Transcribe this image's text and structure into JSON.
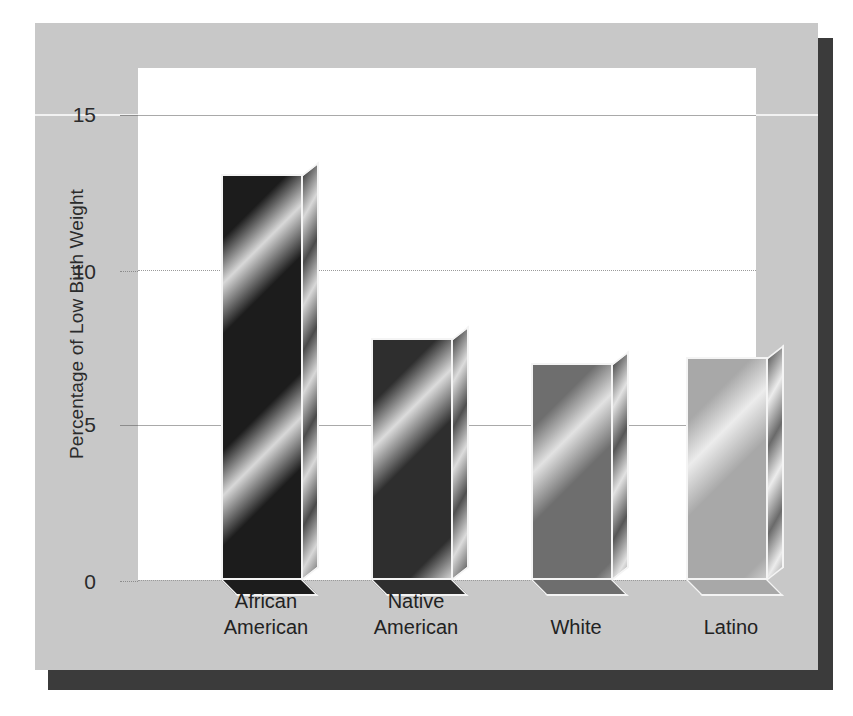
{
  "figure": {
    "background_color": "#c8c8c8",
    "plot_background_color": "#ffffff",
    "shadow_color": "#3b3b3b"
  },
  "chart_data": {
    "type": "bar",
    "title": "",
    "xlabel": "",
    "ylabel": "Percentage of Low Birth Weight",
    "categories": [
      "African American",
      "Native American",
      "White",
      "Latino"
    ],
    "category_lines": [
      [
        "African",
        "American"
      ],
      [
        "Native",
        "American"
      ],
      [
        "White"
      ],
      [
        "Latino"
      ]
    ],
    "values": [
      13.1,
      7.8,
      7.0,
      7.2
    ],
    "ylim": [
      0,
      16.5
    ],
    "yticks": [
      0,
      5,
      10,
      15
    ],
    "ytick_labels": [
      "0",
      "5",
      "10",
      "15"
    ],
    "gridline_styles": [
      "dotted",
      "solid",
      "dotted",
      "solid"
    ],
    "grid": true,
    "legend": "none",
    "bar_colors": [
      "#1c1c1c",
      "#2e2e2e",
      "#6e6e6e",
      "#a8a8a8"
    ],
    "bar_highlight_colors": [
      "#d8d8d8",
      "#dcdcdc",
      "#e2e2e2",
      "#ececec"
    ],
    "bar_side_colors": [
      "#4a4a4a",
      "#4f4f4f",
      "#565656",
      "#6a6a6a"
    ],
    "bar_edge_color": "#f4f4f4",
    "bar_style": "3d-diagonal-gradient"
  }
}
